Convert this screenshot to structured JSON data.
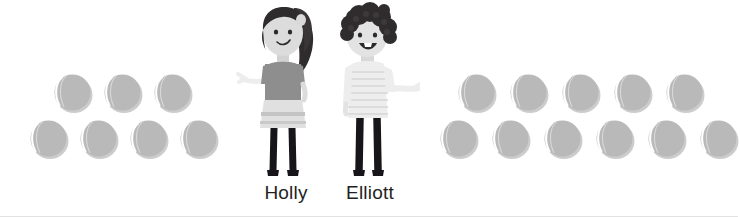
{
  "scene": {
    "background_color": "#ffffff",
    "border_color": "#e2e2e2",
    "item_icon": "tennis-ball-icon",
    "item_color": "#b9b9b9",
    "item_seam_color": "#ffffff"
  },
  "groups": [
    {
      "owner": "Holly",
      "side": "left",
      "total": 7,
      "rows": [
        {
          "count": 3
        },
        {
          "count": 4
        }
      ]
    },
    {
      "owner": "Elliott",
      "side": "right",
      "total": 11,
      "rows": [
        {
          "count": 5
        },
        {
          "count": 6
        }
      ]
    }
  ],
  "characters": [
    {
      "name": "Holly",
      "hair_color": "#2f2c2d",
      "skin_color": "#dcdcdc",
      "top_color": "#8e8e8e",
      "skirt_color": "#e0e0e0",
      "legs_color": "#17151a"
    },
    {
      "name": "Elliott",
      "hair_color": "#2f2c2d",
      "skin_color": "#e3e3e3",
      "top_color": "#ededed",
      "legs_color": "#17151a"
    }
  ]
}
